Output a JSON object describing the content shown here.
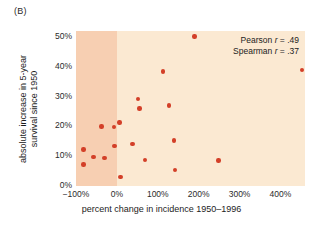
{
  "panel": {
    "label": "(B)"
  },
  "annotation": {
    "pearson_prefix": "Pearson ",
    "pearson_symbol": "r",
    "pearson_value": " = .49",
    "spearman_prefix": "Spearman ",
    "spearman_symbol": "r",
    "spearman_value": " = .37"
  },
  "colors": {
    "dot": "#d33f28",
    "plot_background": "#fbe9d2",
    "negative_band": "#f7cfb2",
    "text": "#1c1c1c"
  },
  "chart_data": {
    "type": "scatter",
    "title": "(B)",
    "xlabel": "percent change in incidence 1950–1996",
    "ylabel": "absolute increase in 5-year survival since 1950",
    "ylabel_line1": "absolute increase in 5-year",
    "ylabel_line2": "survival since 1950",
    "xlim": [
      -100,
      460
    ],
    "ylim": [
      0,
      52
    ],
    "xticks": [
      -100,
      0,
      100,
      200,
      300,
      400
    ],
    "xtick_labels": [
      "−100%",
      "0%",
      "100%",
      "200%",
      "300%",
      "400%"
    ],
    "yticks": [
      0,
      10,
      20,
      30,
      40,
      50
    ],
    "ytick_labels": [
      "0%",
      "10%",
      "20%",
      "30%",
      "40%",
      "50%"
    ],
    "grid": false,
    "legend": null,
    "shaded_region": {
      "x_from": -100,
      "x_to": 0,
      "note": "declining incidence band"
    },
    "annotations": [
      "Pearson r = .49",
      "Spearman r = .37"
    ],
    "points": [
      {
        "x": -82,
        "y": 12.3
      },
      {
        "x": -82,
        "y": 7.2
      },
      {
        "x": -57,
        "y": 9.8
      },
      {
        "x": -38,
        "y": 20.0
      },
      {
        "x": -30,
        "y": 9.4
      },
      {
        "x": -7,
        "y": 19.8
      },
      {
        "x": -6,
        "y": 13.5
      },
      {
        "x": 6,
        "y": 21.3
      },
      {
        "x": 9,
        "y": 3.0
      },
      {
        "x": 38,
        "y": 14.1
      },
      {
        "x": 52,
        "y": 29.2
      },
      {
        "x": 55,
        "y": 26.0
      },
      {
        "x": 68,
        "y": 8.8
      },
      {
        "x": 112,
        "y": 38.4
      },
      {
        "x": 128,
        "y": 27.0
      },
      {
        "x": 140,
        "y": 15.3
      },
      {
        "x": 142,
        "y": 5.3
      },
      {
        "x": 190,
        "y": 50.2
      },
      {
        "x": 248,
        "y": 8.6
      },
      {
        "x": 452,
        "y": 39.0
      }
    ]
  }
}
